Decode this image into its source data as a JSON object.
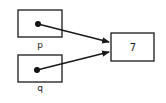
{
  "diagram": {
    "type": "pointer-diagram",
    "pointers": [
      {
        "name": "p",
        "label": "p",
        "target": "value_box"
      },
      {
        "name": "q",
        "label": "q",
        "target": "value_box"
      }
    ],
    "value_box": {
      "value": "7"
    },
    "colors": {
      "stroke": "#1a1a1a",
      "dot": "#111111",
      "background": "#ffffff"
    }
  }
}
